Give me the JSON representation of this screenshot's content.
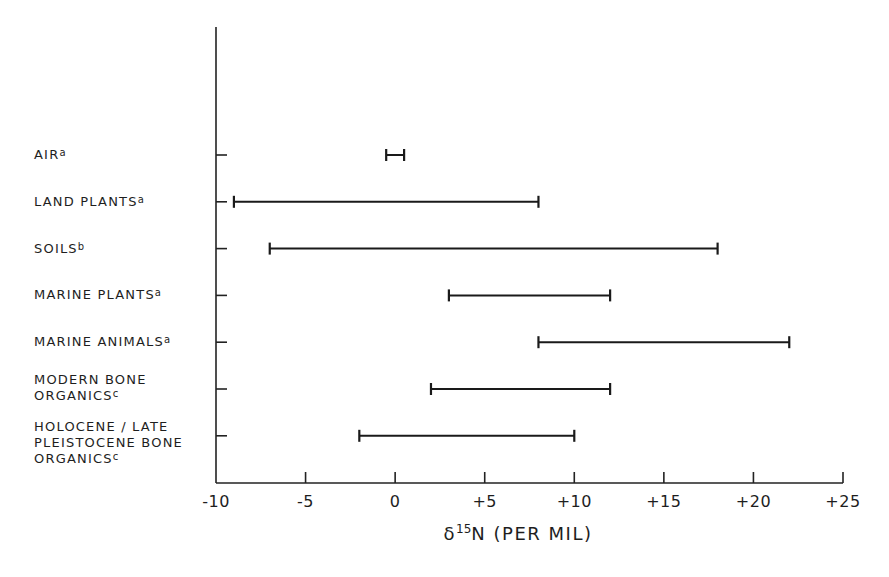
{
  "chart_data": {
    "type": "range",
    "title": "",
    "xlabel": "δ15N (PER MIL)",
    "xlabel_parts": {
      "symbol": "δ",
      "isotope": "15",
      "element": "N",
      "unit": " (PER MIL)"
    },
    "ylabel": "",
    "xlim": [
      -10,
      25
    ],
    "x_ticks": [
      -10,
      -5,
      0,
      5,
      10,
      15,
      20,
      25
    ],
    "x_tick_labels": [
      "-10",
      "-5",
      "0",
      "+5",
      "+10",
      "+15",
      "+20",
      "+25"
    ],
    "grid": false,
    "legend": "none",
    "categories": [
      {
        "lines": [
          "AIR"
        ],
        "footnote": "a",
        "min": -0.5,
        "max": 0.5
      },
      {
        "lines": [
          "LAND PLANTS"
        ],
        "footnote": "a",
        "min": -9,
        "max": 8
      },
      {
        "lines": [
          "SOILS"
        ],
        "footnote": "b",
        "min": -7,
        "max": 18
      },
      {
        "lines": [
          "MARINE PLANTS"
        ],
        "footnote": "a",
        "min": 3,
        "max": 12
      },
      {
        "lines": [
          "MARINE ANIMALS"
        ],
        "footnote": "a",
        "min": 8,
        "max": 22
      },
      {
        "lines": [
          "MODERN BONE",
          "ORGANICS"
        ],
        "footnote": "c",
        "min": 2,
        "max": 12
      },
      {
        "lines": [
          "HOLOCENE / LATE",
          "PLEISTOCENE BONE",
          "ORGANICS"
        ],
        "footnote": "c",
        "min": -2,
        "max": 10
      }
    ]
  }
}
